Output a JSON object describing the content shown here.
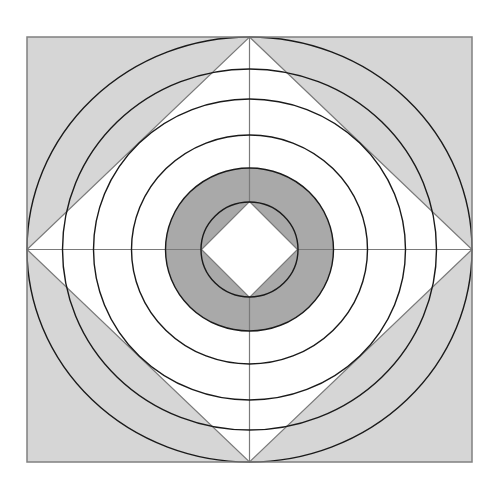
{
  "diagram": {
    "title": "",
    "canvas": {
      "width": 500,
      "height": 495,
      "background": "#ffffff"
    },
    "center": {
      "x": 249.5,
      "y": 249.5
    },
    "frame": {
      "x": 27,
      "y": 37,
      "width": 445,
      "height": 425,
      "fill": "#d6d6d6",
      "stroke": "#808080"
    },
    "outer_diamond": {
      "rx": 222.5,
      "ry": 212.5,
      "fill": "#ffffff",
      "stroke": "#7a7a7a"
    },
    "rings": [
      {
        "name": "ring-1-outer",
        "rx": 222.5,
        "ry": 212.5
      },
      {
        "name": "ring-2",
        "rx": 187,
        "ry": 180.5
      },
      {
        "name": "ring-3",
        "rx": 156,
        "ry": 150.5
      },
      {
        "name": "ring-4",
        "rx": 118,
        "ry": 114.5
      },
      {
        "name": "ring-5-shaded-outer",
        "rx": 84,
        "ry": 81.5
      },
      {
        "name": "ring-6-inner",
        "rx": 48.5,
        "ry": 47.5
      }
    ],
    "shaded_annulus": {
      "outer_rx": 84,
      "outer_ry": 81.5,
      "fill": "#a9a9a9"
    },
    "inner_diamond": {
      "rx": 48,
      "ry": 48,
      "fill": "#ffffff",
      "stroke": "#7a7a7a"
    },
    "axes": {
      "stroke": "#7a7a7a"
    },
    "ring_stroke": "#1a1a1a"
  }
}
